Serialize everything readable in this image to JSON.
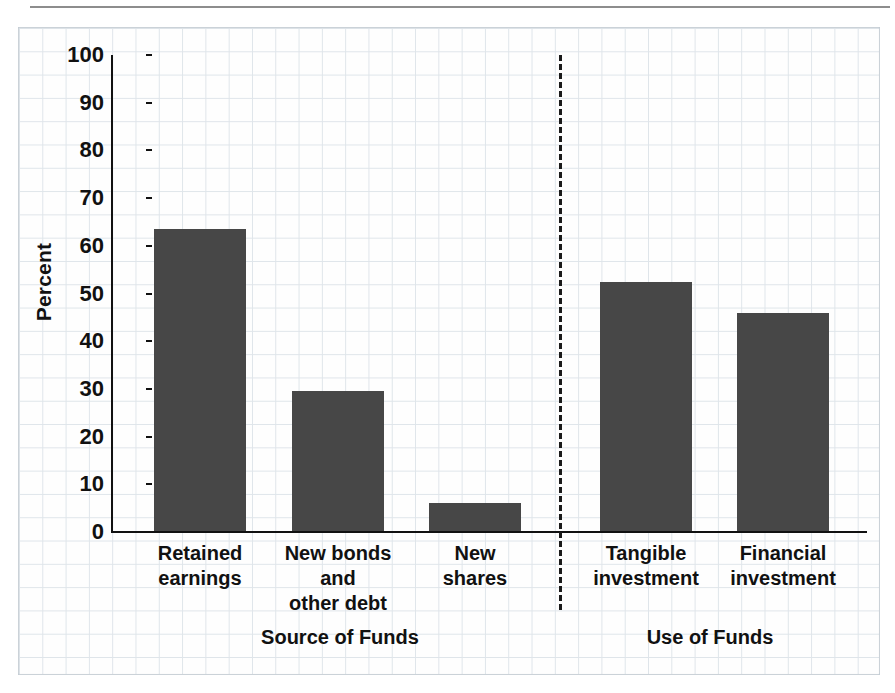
{
  "figure": {
    "background_color": "#ffffff",
    "paper_color": "#fefefe",
    "grid_color": "#dfe5ea",
    "bar_color": "#474747",
    "axis_color": "#111111"
  },
  "chart_data": {
    "type": "bar",
    "title": "",
    "xlabel": "",
    "ylabel": "Percent",
    "ylim": [
      0,
      100
    ],
    "ytick_labels": [
      "100",
      "90",
      "80",
      "70",
      "60",
      "50",
      "40",
      "30",
      "20",
      "10",
      "0"
    ],
    "ytick_values": [
      100,
      90,
      80,
      70,
      60,
      50,
      40,
      30,
      20,
      10,
      0
    ],
    "grid": true,
    "legend": "none",
    "categories": [
      "Retained\nearnings",
      "New bonds\nand\nother debt",
      "New\nshares",
      "Tangible\ninvestment",
      "Financial\ninvestment"
    ],
    "values": [
      63.5,
      29.6,
      6.0,
      52.4,
      45.9
    ],
    "groups": [
      {
        "label": "Source of Funds",
        "categories": [
          "Retained earnings",
          "New bonds and other debt",
          "New shares"
        ]
      },
      {
        "label": "Use of Funds",
        "categories": [
          "Tangible investment",
          "Financial investment"
        ]
      }
    ],
    "annotations": [
      {
        "kind": "divider",
        "style": "dashed-vertical",
        "between": [
          "Source of Funds",
          "Use of Funds"
        ]
      }
    ]
  },
  "axis": {
    "y_title": "Percent",
    "ticks": [
      {
        "label": "100",
        "value": 100
      },
      {
        "label": "90",
        "value": 90
      },
      {
        "label": "80",
        "value": 80
      },
      {
        "label": "70",
        "value": 70
      },
      {
        "label": "60",
        "value": 60
      },
      {
        "label": "50",
        "value": 50
      },
      {
        "label": "40",
        "value": 40
      },
      {
        "label": "30",
        "value": 30
      },
      {
        "label": "20",
        "value": 20
      },
      {
        "label": "10",
        "value": 10
      },
      {
        "label": "0",
        "value": 0
      }
    ]
  },
  "bars": [
    {
      "label": "Retained\nearnings",
      "value": 63.5
    },
    {
      "label": "New bonds\nand\nother debt",
      "value": 29.6
    },
    {
      "label": "New\nshares",
      "value": 6.0
    },
    {
      "label": "Tangible\ninvestment",
      "value": 52.4
    },
    {
      "label": "Financial\ninvestment",
      "value": 45.9
    }
  ],
  "groups": [
    {
      "label": "Source of Funds"
    },
    {
      "label": "Use of Funds"
    }
  ]
}
